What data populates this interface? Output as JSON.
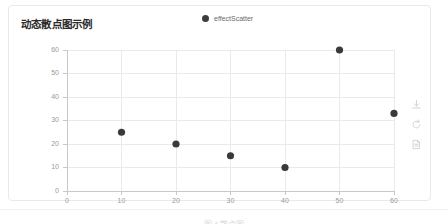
{
  "card": {
    "title": "动态散点图示例"
  },
  "legend": {
    "items": [
      {
        "label": "effectScatter",
        "color": "#3d3d3d",
        "icon": "circle-marker"
      }
    ]
  },
  "toolbox": {
    "items": [
      {
        "name": "save-as-image",
        "icon": "download-icon"
      },
      {
        "name": "restore",
        "icon": "refresh-icon"
      },
      {
        "name": "data-view",
        "icon": "document-icon"
      }
    ]
  },
  "caption": {
    "text": "图 4  散点图"
  },
  "colors": {
    "point": "#3a3a3a",
    "grid": "#eaeaea",
    "axis": "#c8c8c8",
    "tick_label": "#9a9a9a",
    "title": "#2b2b2b",
    "card_border": "#e9e9e9"
  },
  "chart_data": {
    "type": "scatter",
    "title": "动态散点图示例",
    "xlabel": "",
    "ylabel": "",
    "xlim": [
      0,
      60
    ],
    "ylim": [
      0,
      60
    ],
    "xticks": [
      0,
      10,
      20,
      30,
      40,
      50,
      60
    ],
    "yticks": [
      0,
      10,
      20,
      30,
      40,
      50,
      60
    ],
    "grid": true,
    "legend_position": "top-center",
    "series": [
      {
        "name": "effectScatter",
        "color": "#3a3a3a",
        "points": [
          {
            "x": 10,
            "y": 25
          },
          {
            "x": 20,
            "y": 20
          },
          {
            "x": 30,
            "y": 15
          },
          {
            "x": 40,
            "y": 10
          },
          {
            "x": 50,
            "y": 60
          },
          {
            "x": 60,
            "y": 33
          }
        ]
      }
    ]
  }
}
